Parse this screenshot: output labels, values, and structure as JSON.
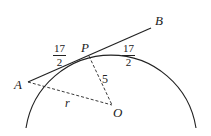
{
  "diagram": {
    "type": "geometry",
    "points": {
      "A": {
        "label": "A",
        "x": 28,
        "y": 82
      },
      "B": {
        "label": "B",
        "x": 151,
        "y": 28
      },
      "P": {
        "label": "P",
        "x": 89,
        "y": 56
      },
      "O": {
        "label": "O",
        "x": 112,
        "y": 105
      }
    },
    "segments": [
      {
        "from": "A",
        "to": "B",
        "style": "solid"
      },
      {
        "from": "P",
        "to": "O",
        "style": "dashed",
        "label": "5"
      },
      {
        "from": "A",
        "to": "O",
        "style": "dashed",
        "label": "r"
      }
    ],
    "labels": {
      "A": "A",
      "B": "B",
      "P": "P",
      "O": "O",
      "AP_num": "17",
      "AP_den": "2",
      "PB_num": "17",
      "PB_den": "2",
      "PO": "5",
      "AO": "r"
    },
    "colors": {
      "stroke": "#222222"
    }
  }
}
